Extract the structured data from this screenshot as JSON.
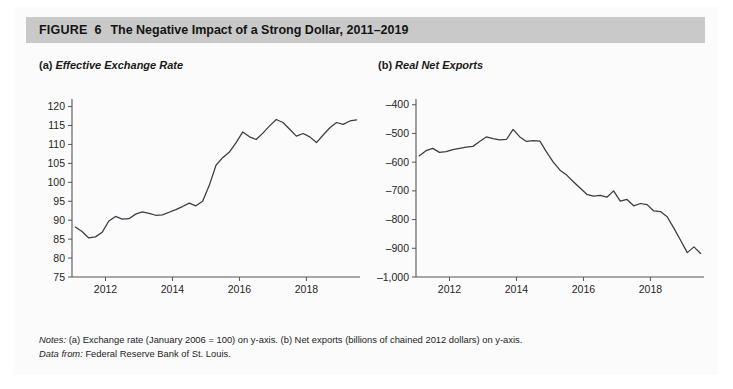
{
  "figure": {
    "label": "FIGURE",
    "number": "6",
    "title": "The Negative Impact of a Strong Dollar, 2011–2019"
  },
  "panels": [
    {
      "id": "a",
      "prefix": "(a)",
      "title": "Effective Exchange Rate"
    },
    {
      "id": "b",
      "prefix": "(b)",
      "title": "Real Net Exports"
    }
  ],
  "notes": {
    "notes_label": "Notes:",
    "notes_text": "(a) Exchange rate (January 2006 = 100) on y-axis. (b) Net exports (billions of chained 2012 dollars) on y-axis.",
    "source_label": "Data from:",
    "source_text": "Federal Reserve Bank of St. Louis."
  },
  "chart_data": [
    {
      "type": "line",
      "panel": "a",
      "title": "(a) Effective Exchange Rate",
      "xlabel": "",
      "ylabel": "Exchange rate (January 2006 = 100)",
      "xlim": [
        2011.0,
        2019.6
      ],
      "ylim": [
        75,
        122
      ],
      "yticks": [
        75,
        80,
        85,
        90,
        95,
        100,
        105,
        110,
        115,
        120
      ],
      "ytick_labels": [
        "75",
        "80",
        "85",
        "90",
        "95",
        "100",
        "105",
        "110",
        "115",
        "120"
      ],
      "xticks": [
        2012,
        2014,
        2016,
        2018
      ],
      "xtick_labels": [
        "2012",
        "2014",
        "2016",
        "2018"
      ],
      "grid": false,
      "legend": "none",
      "line_color": "#3b3b44",
      "series": [
        {
          "name": "Effective Exchange Rate",
          "x": [
            2011.1,
            2011.3,
            2011.5,
            2011.7,
            2011.9,
            2012.1,
            2012.3,
            2012.5,
            2012.7,
            2012.9,
            2013.1,
            2013.3,
            2013.5,
            2013.7,
            2013.9,
            2014.1,
            2014.3,
            2014.5,
            2014.7,
            2014.9,
            2015.1,
            2015.3,
            2015.5,
            2015.7,
            2015.9,
            2016.1,
            2016.3,
            2016.5,
            2016.7,
            2016.9,
            2017.1,
            2017.3,
            2017.5,
            2017.7,
            2017.9,
            2018.1,
            2018.3,
            2018.5,
            2018.7,
            2018.9,
            2019.1,
            2019.3,
            2019.5
          ],
          "values": [
            88.2,
            87.0,
            85.3,
            85.6,
            86.8,
            89.8,
            91.0,
            90.3,
            90.4,
            91.6,
            92.2,
            91.8,
            91.3,
            91.4,
            92.1,
            92.8,
            93.6,
            94.5,
            93.8,
            95.0,
            99.2,
            104.5,
            106.5,
            108.0,
            110.5,
            113.3,
            112.0,
            111.3,
            113.0,
            114.9,
            116.6,
            115.8,
            114.0,
            112.2,
            112.9,
            112.0,
            110.5,
            112.5,
            114.4,
            115.8,
            115.3,
            116.2,
            116.5,
            117.0
          ]
        }
      ]
    },
    {
      "type": "line",
      "panel": "b",
      "title": "(b) Real Net Exports",
      "xlabel": "",
      "ylabel": "Net exports (billions of chained 2012 dollars)",
      "xlim": [
        2011.0,
        2019.6
      ],
      "ylim": [
        -1000,
        -380
      ],
      "yticks": [
        -1000,
        -900,
        -800,
        -700,
        -600,
        -500,
        -400
      ],
      "ytick_labels": [
        "–1,000",
        "–900",
        "–800",
        "–700",
        "–600",
        "–500",
        "–400"
      ],
      "xticks": [
        2012,
        2014,
        2016,
        2018
      ],
      "xtick_labels": [
        "2012",
        "2014",
        "2016",
        "2018"
      ],
      "grid": false,
      "legend": "none",
      "line_color": "#3b3b44",
      "series": [
        {
          "name": "Real Net Exports",
          "x": [
            2011.1,
            2011.3,
            2011.5,
            2011.7,
            2011.9,
            2012.1,
            2012.3,
            2012.5,
            2012.7,
            2012.9,
            2013.1,
            2013.3,
            2013.5,
            2013.7,
            2013.9,
            2014.1,
            2014.3,
            2014.5,
            2014.7,
            2014.9,
            2015.1,
            2015.3,
            2015.5,
            2015.7,
            2015.9,
            2016.1,
            2016.3,
            2016.5,
            2016.7,
            2016.9,
            2017.1,
            2017.3,
            2017.5,
            2017.7,
            2017.9,
            2018.1,
            2018.3,
            2018.5,
            2018.7,
            2018.9,
            2019.1,
            2019.3,
            2019.5
          ],
          "values": [
            -578,
            -560,
            -552,
            -566,
            -563,
            -556,
            -552,
            -548,
            -545,
            -528,
            -512,
            -518,
            -522,
            -521,
            -486,
            -512,
            -528,
            -525,
            -527,
            -565,
            -600,
            -628,
            -645,
            -668,
            -690,
            -712,
            -718,
            -716,
            -722,
            -700,
            -736,
            -730,
            -752,
            -744,
            -748,
            -770,
            -772,
            -790,
            -830,
            -872,
            -915,
            -895,
            -918,
            -840
          ]
        }
      ]
    }
  ]
}
